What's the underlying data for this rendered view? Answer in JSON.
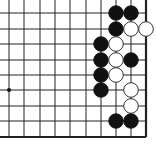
{
  "board": {
    "title": "Go board diagram (lower-right corner section)",
    "background": "#ffffff",
    "line_color": "#222222",
    "columns_x": [
      9,
      24,
      40,
      55,
      70,
      86,
      101,
      116,
      131,
      146
    ],
    "rows_y": [
      13,
      29,
      44,
      60,
      75,
      90,
      106,
      121,
      137
    ],
    "edges": {
      "right": true,
      "bottom": true,
      "top": false,
      "left": false
    },
    "stone_radius": 7.3,
    "star_points": [
      {
        "col": 0,
        "row": 5
      }
    ],
    "stones": [
      {
        "color": "black",
        "col": 7,
        "row": 0
      },
      {
        "color": "black",
        "col": 8,
        "row": 0
      },
      {
        "color": "black",
        "col": 7,
        "row": 1
      },
      {
        "color": "white",
        "col": 8,
        "row": 1
      },
      {
        "color": "white",
        "col": 9,
        "row": 1
      },
      {
        "color": "black",
        "col": 6,
        "row": 2
      },
      {
        "color": "white",
        "col": 7,
        "row": 2
      },
      {
        "color": "black",
        "col": 6,
        "row": 3
      },
      {
        "color": "white",
        "col": 7,
        "row": 3
      },
      {
        "color": "black",
        "col": 8,
        "row": 3
      },
      {
        "color": "black",
        "col": 6,
        "row": 4
      },
      {
        "color": "white",
        "col": 7,
        "row": 4
      },
      {
        "color": "black",
        "col": 6,
        "row": 5
      },
      {
        "color": "white",
        "col": 8,
        "row": 5
      },
      {
        "color": "white",
        "col": 8,
        "row": 6
      },
      {
        "color": "black",
        "col": 7,
        "row": 7
      },
      {
        "color": "black",
        "col": 8,
        "row": 7
      }
    ]
  }
}
